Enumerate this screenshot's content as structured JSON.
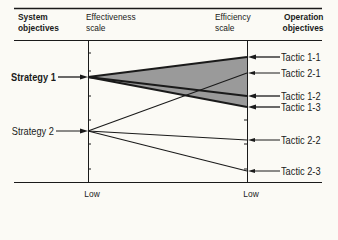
{
  "header": {
    "col1": {
      "line1": "System",
      "line2": "objectives"
    },
    "col2": {
      "line1": "Effectiveness",
      "line2": "scale"
    },
    "col3": {
      "line1": "Efficiency",
      "line2": "scale"
    },
    "col4": {
      "line1": "Operation",
      "line2": "objectives"
    }
  },
  "strategies": [
    {
      "label": "Strategy 1",
      "y": 77,
      "bold": true
    },
    {
      "label": "Strategy 2",
      "y": 131,
      "bold": false
    }
  ],
  "tactics": [
    {
      "label": "Tactic 1-1",
      "y": 57,
      "strategy": "Strategy 1"
    },
    {
      "label": "Tactic 2-1",
      "y": 73,
      "strategy": "Strategy 2"
    },
    {
      "label": "Tactic 1-2",
      "y": 96,
      "strategy": "Strategy 1"
    },
    {
      "label": "Tactic 1-3",
      "y": 107,
      "strategy": "Strategy 1"
    },
    {
      "label": "Tactic 2-2",
      "y": 140,
      "strategy": "Strategy 2"
    },
    {
      "label": "Tactic 2-3",
      "y": 171,
      "strategy": "Strategy 2"
    }
  ],
  "axes": {
    "effectiveness_low_label": "Low",
    "efficiency_low_label": "Low"
  },
  "colors": {
    "background": "#fbfaf5",
    "ink": "#1a1a1a",
    "shaded_region": "#9a9a9a"
  }
}
